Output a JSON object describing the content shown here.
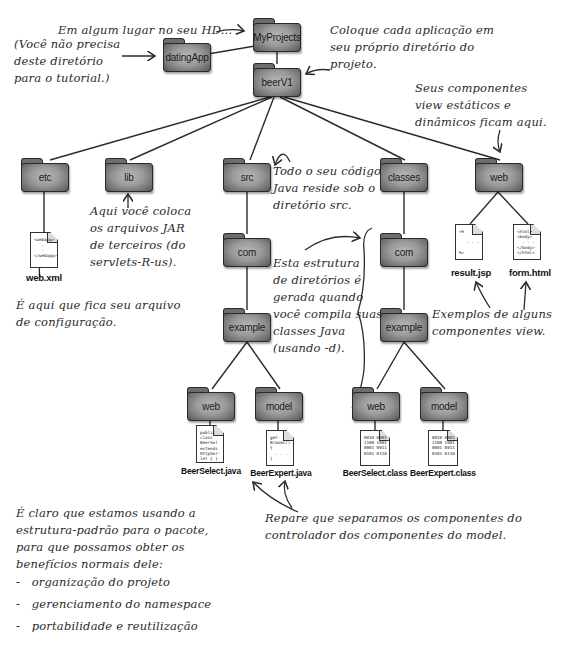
{
  "diagram": {
    "folders": {
      "root": "MyProjects",
      "dating_app": "datingApp",
      "project": "beerV1",
      "etc": "etc",
      "lib": "lib",
      "src": "src",
      "classes": "classes",
      "web_root": "web",
      "src_com": "com",
      "src_example": "example",
      "src_web": "web",
      "src_model": "model",
      "classes_com": "com",
      "classes_example": "example",
      "classes_web": "web",
      "classes_model": "model"
    },
    "files": {
      "web_xml": {
        "name": "web.xml",
        "code": "<webapp>\n   .\n   .\n</webapp>"
      },
      "result_jsp": {
        "name": "result.jsp",
        "code": "<%\n\n   . . .\n\n%>"
      },
      "form_html": {
        "name": "form.html",
        "code": "<html>\n<body>\n  . . .\n</body>\n</html>"
      },
      "beer_select_java": {
        "name": "BeerSelect.java",
        "code": "public\nclass\nBeerSel\nextends\nHttpSer-\nlet { }"
      },
      "beer_expert_java": {
        "name": "BeerExpert.java",
        "code": "get-\nBrands()\n{\n  . . .\n}"
      },
      "beer_select_class": {
        "name": "BeerSelect.class",
        "code": "0010 0001\n1100 1001\n0001 0011\n0101 0110"
      },
      "beer_expert_class": {
        "name": "BeerExpert.class",
        "code": "0010 0001\n1100 1001\n0001 0011\n0101 0110"
      }
    },
    "annotations": {
      "hd": "Em algum lugar no seu HD...",
      "dating_note": "(Você não precisa\ndeste diretório\npara o tutorial.)",
      "each_app": "Coloque cada aplicação em\nseu próprio diretório do\nprojeto.",
      "view_components": "Seus componentes\nview estáticos e\ndinâmicos ficam aqui.",
      "jar_note": "Aqui você coloca\nos arquivos JAR\nde terceiros (do\nservlets-R-us).",
      "src_note": "Todo o seu código\nJava reside sob o\ndiretório src.",
      "generated_note": "Esta estrutura\nde diretórios é\ngerada quando\nvocê compila suas\nclasses Java\n(usando -d).",
      "config_note": "É aqui que fica seu arquivo\nde configuração.",
      "view_examples": "Exemplos de alguns\ncomponentes view.",
      "separation_note": "Repare que separamos os componentes do\ncontrolador dos componentes do model.",
      "package_note": "É claro que estamos usando a\nestrutura-padrão para o pacote,\npara que possamos obter os\nbenefícios normais dele:",
      "benefits": [
        "-   organização do projeto",
        "-   gerenciamento do namespace",
        "-   portabilidade e reutilização"
      ]
    },
    "colors": {
      "folder_fill": "#9a9a9a",
      "folder_border": "#2a2a2a",
      "line": "#2b2b2b",
      "background": "#ffffff"
    }
  }
}
